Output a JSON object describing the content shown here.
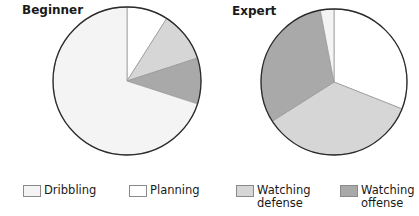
{
  "chart_data": [
    {
      "type": "pie",
      "title": "Beginner",
      "labels": [
        "Dribbling",
        "Planning",
        "Watching defense",
        "Watching offense"
      ],
      "values": [
        70,
        9,
        11,
        10
      ],
      "start_angle_deg": 0,
      "direction": "clockwise",
      "order": [
        "Planning",
        "Watching defense",
        "Watching offense",
        "Dribbling"
      ]
    },
    {
      "type": "pie",
      "title": "Expert",
      "labels": [
        "Dribbling",
        "Planning",
        "Watching defense",
        "Watching offense"
      ],
      "values": [
        3,
        31,
        35,
        31
      ],
      "start_angle_deg": 0,
      "direction": "clockwise",
      "order": [
        "Planning",
        "Watching defense",
        "Watching offense",
        "Dribbling"
      ]
    }
  ],
  "titles": {
    "left": "Beginner",
    "right": "Expert"
  },
  "legend": [
    {
      "label_line1": "Dribbling",
      "label_line2": "",
      "color": "#f4f4f4"
    },
    {
      "label_line1": "Planning",
      "label_line2": "",
      "color": "#ffffff"
    },
    {
      "label_line1": "Watching",
      "label_line2": "defense",
      "color": "#d6d6d6"
    },
    {
      "label_line1": "Watching",
      "label_line2": "offense",
      "color": "#a9a9a9"
    }
  ],
  "colors": {
    "Dribbling": "#f4f4f4",
    "Planning": "#ffffff",
    "Watching defense": "#d6d6d6",
    "Watching offense": "#a9a9a9"
  }
}
